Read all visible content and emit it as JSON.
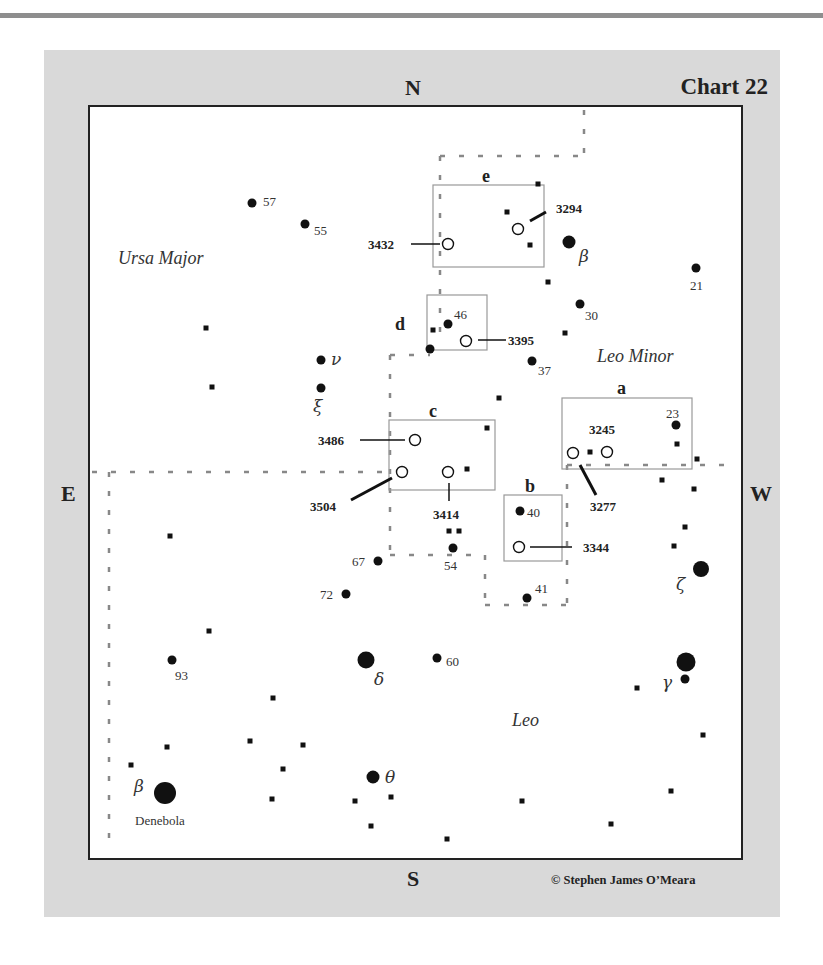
{
  "page": {
    "chart_title": "Chart 22",
    "copyright": "© Stephen James O’Meara",
    "compass": {
      "north": "N",
      "south": "S",
      "east": "E",
      "west": "W"
    }
  },
  "constellations": [
    {
      "name": "Ursa Major",
      "x": 118,
      "y": 264
    },
    {
      "name": "Leo Minor",
      "x": 597,
      "y": 362
    },
    {
      "name": "Leo",
      "x": 512,
      "y": 726
    }
  ],
  "detail_boxes": [
    {
      "label": "e",
      "x": 433,
      "y": 185,
      "w": 111,
      "h": 82,
      "lx": 482,
      "ly": 182
    },
    {
      "label": "d",
      "x": 427,
      "y": 295,
      "w": 60,
      "h": 55,
      "lx": 395,
      "ly": 330
    },
    {
      "label": "c",
      "x": 389,
      "y": 420,
      "w": 106,
      "h": 70,
      "lx": 429,
      "ly": 417
    },
    {
      "label": "a",
      "x": 562,
      "y": 398,
      "w": 130,
      "h": 71,
      "lx": 617,
      "ly": 394
    },
    {
      "label": "b",
      "x": 504,
      "y": 495,
      "w": 58,
      "h": 66,
      "lx": 525,
      "ly": 492
    }
  ],
  "galaxies": [
    {
      "ngc": "3294",
      "x": 518,
      "y": 229,
      "lx": 556,
      "ly": 213,
      "line": [
        530,
        221,
        546,
        212
      ]
    },
    {
      "ngc": "3432",
      "x": 448,
      "y": 244,
      "lx": 368,
      "ly": 249,
      "line": [
        411,
        244,
        440,
        244
      ]
    },
    {
      "ngc": "3395",
      "x": 466,
      "y": 341,
      "lx": 508,
      "ly": 345,
      "line": [
        478,
        340,
        506,
        340
      ]
    },
    {
      "ngc": "3486",
      "x": 415,
      "y": 440,
      "lx": 318,
      "ly": 445,
      "line": [
        360,
        440,
        405,
        440
      ]
    },
    {
      "ngc": "3504",
      "x": 402,
      "y": 472,
      "lx": 310,
      "ly": 511,
      "line": [
        351,
        500,
        392,
        478
      ]
    },
    {
      "ngc": "3414",
      "x": 448,
      "y": 472,
      "lx": 433,
      "ly": 519,
      "line": [
        449,
        483,
        449,
        501
      ]
    },
    {
      "ngc": "3245",
      "x": 607,
      "y": 452,
      "lx": 589,
      "ly": 434,
      "line": null
    },
    {
      "ngc": "3277",
      "x": 573,
      "y": 453,
      "lx": 590,
      "ly": 511,
      "line": [
        580,
        465,
        596,
        495
      ]
    },
    {
      "ngc": "3344",
      "x": 519,
      "y": 547,
      "lx": 583,
      "ly": 552,
      "line": [
        530,
        547,
        572,
        547
      ]
    }
  ],
  "stars": [
    {
      "id": "57",
      "x": 252,
      "y": 203,
      "r": 4.5,
      "label": "57",
      "lx": 263,
      "ly": 206
    },
    {
      "id": "55",
      "x": 305,
      "y": 224,
      "r": 4.5,
      "label": "55",
      "lx": 314,
      "ly": 235
    },
    {
      "id": "beta-lmi",
      "x": 569,
      "y": 242,
      "r": 6.5,
      "label": "β",
      "lx": 579,
      "ly": 262,
      "greek": true
    },
    {
      "id": "21",
      "x": 696,
      "y": 268,
      "r": 4.5,
      "label": "21",
      "lx": 690,
      "ly": 290
    },
    {
      "id": "30",
      "x": 580,
      "y": 304,
      "r": 4.5,
      "label": "30",
      "lx": 585,
      "ly": 320
    },
    {
      "id": "46",
      "x": 448,
      "y": 324,
      "r": 4.5,
      "label": "46",
      "lx": 454,
      "ly": 319
    },
    {
      "id": "d-star",
      "x": 430,
      "y": 349,
      "r": 4.5,
      "label": "",
      "lx": 0,
      "ly": 0
    },
    {
      "id": "37",
      "x": 532,
      "y": 361,
      "r": 4.5,
      "label": "37",
      "lx": 538,
      "ly": 375
    },
    {
      "id": "nu",
      "x": 321,
      "y": 360,
      "r": 4.5,
      "label": "ν",
      "lx": 331,
      "ly": 365,
      "greek": true
    },
    {
      "id": "xi",
      "x": 321,
      "y": 388,
      "r": 4.5,
      "label": "ξ",
      "lx": 313,
      "ly": 412,
      "greek": true
    },
    {
      "id": "23",
      "x": 676,
      "y": 425,
      "r": 4.5,
      "label": "23",
      "lx": 666,
      "ly": 418
    },
    {
      "id": "40",
      "x": 520,
      "y": 511,
      "r": 4.5,
      "label": "40",
      "lx": 527,
      "ly": 517
    },
    {
      "id": "54",
      "x": 453,
      "y": 548,
      "r": 4.5,
      "label": "54",
      "lx": 444,
      "ly": 570
    },
    {
      "id": "67",
      "x": 378,
      "y": 561,
      "r": 4.5,
      "label": "67",
      "lx": 352,
      "ly": 566
    },
    {
      "id": "72",
      "x": 346,
      "y": 594,
      "r": 4.5,
      "label": "72",
      "lx": 320,
      "ly": 599
    },
    {
      "id": "41",
      "x": 527,
      "y": 598,
      "r": 4.5,
      "label": "41",
      "lx": 535,
      "ly": 593
    },
    {
      "id": "zeta",
      "x": 701,
      "y": 569,
      "r": 8,
      "label": "ζ",
      "lx": 676,
      "ly": 590,
      "greek": true
    },
    {
      "id": "93",
      "x": 172,
      "y": 660,
      "r": 4.5,
      "label": "93",
      "lx": 175,
      "ly": 680
    },
    {
      "id": "delta",
      "x": 366,
      "y": 660,
      "r": 8.5,
      "label": "δ",
      "lx": 374,
      "ly": 685,
      "greek": true
    },
    {
      "id": "60",
      "x": 437,
      "y": 658,
      "r": 4.5,
      "label": "60",
      "lx": 446,
      "ly": 666
    },
    {
      "id": "gamma",
      "x": 686,
      "y": 662,
      "r": 9.5,
      "label": "",
      "lx": 0,
      "ly": 0
    },
    {
      "id": "gamma-b",
      "x": 685,
      "y": 679,
      "r": 4.5,
      "label": "γ",
      "lx": 662,
      "ly": 688,
      "greek": true
    },
    {
      "id": "theta",
      "x": 373,
      "y": 777,
      "r": 6.5,
      "label": "θ",
      "lx": 385,
      "ly": 783,
      "greek": true
    },
    {
      "id": "beta-leo",
      "x": 165,
      "y": 793,
      "r": 11,
      "label": "β",
      "lx": 134,
      "ly": 792,
      "greek": true
    }
  ],
  "star_names": [
    {
      "name": "Denebola",
      "x": 135,
      "y": 825
    }
  ],
  "faint_stars": [
    [
      538,
      184
    ],
    [
      507,
      212
    ],
    [
      530,
      245
    ],
    [
      548,
      282
    ],
    [
      565,
      333
    ],
    [
      433,
      330
    ],
    [
      206,
      328
    ],
    [
      212,
      387
    ],
    [
      499,
      398
    ],
    [
      487,
      428
    ],
    [
      677,
      444
    ],
    [
      590,
      452
    ],
    [
      467,
      469
    ],
    [
      697,
      459
    ],
    [
      662,
      480
    ],
    [
      694,
      489
    ],
    [
      685,
      527
    ],
    [
      674,
      546
    ],
    [
      449,
      531
    ],
    [
      459,
      531
    ],
    [
      170,
      536
    ],
    [
      209,
      631
    ],
    [
      273,
      698
    ],
    [
      637,
      688
    ],
    [
      703,
      735
    ],
    [
      167,
      747
    ],
    [
      131,
      765
    ],
    [
      250,
      741
    ],
    [
      303,
      745
    ],
    [
      283,
      769
    ],
    [
      272,
      799
    ],
    [
      355,
      801
    ],
    [
      391,
      797
    ],
    [
      371,
      826
    ],
    [
      522,
      801
    ],
    [
      447,
      839
    ],
    [
      611,
      824
    ],
    [
      671,
      791
    ]
  ],
  "dashed_boundaries": [
    [
      [
        440,
        156
      ],
      [
        584,
        156
      ]
    ],
    [
      [
        584,
        110
      ],
      [
        584,
        156
      ]
    ],
    [
      [
        440,
        156
      ],
      [
        440,
        345
      ]
    ],
    [
      [
        390,
        355
      ],
      [
        430,
        355
      ]
    ],
    [
      [
        390,
        355
      ],
      [
        390,
        555
      ]
    ],
    [
      [
        92,
        472
      ],
      [
        390,
        472
      ]
    ],
    [
      [
        109,
        472
      ],
      [
        109,
        852
      ]
    ],
    [
      [
        390,
        555
      ],
      [
        485,
        555
      ]
    ],
    [
      [
        485,
        555
      ],
      [
        485,
        605
      ]
    ],
    [
      [
        485,
        605
      ],
      [
        567,
        605
      ]
    ],
    [
      [
        567,
        465
      ],
      [
        567,
        605
      ]
    ],
    [
      [
        567,
        465
      ],
      [
        738,
        465
      ]
    ]
  ]
}
